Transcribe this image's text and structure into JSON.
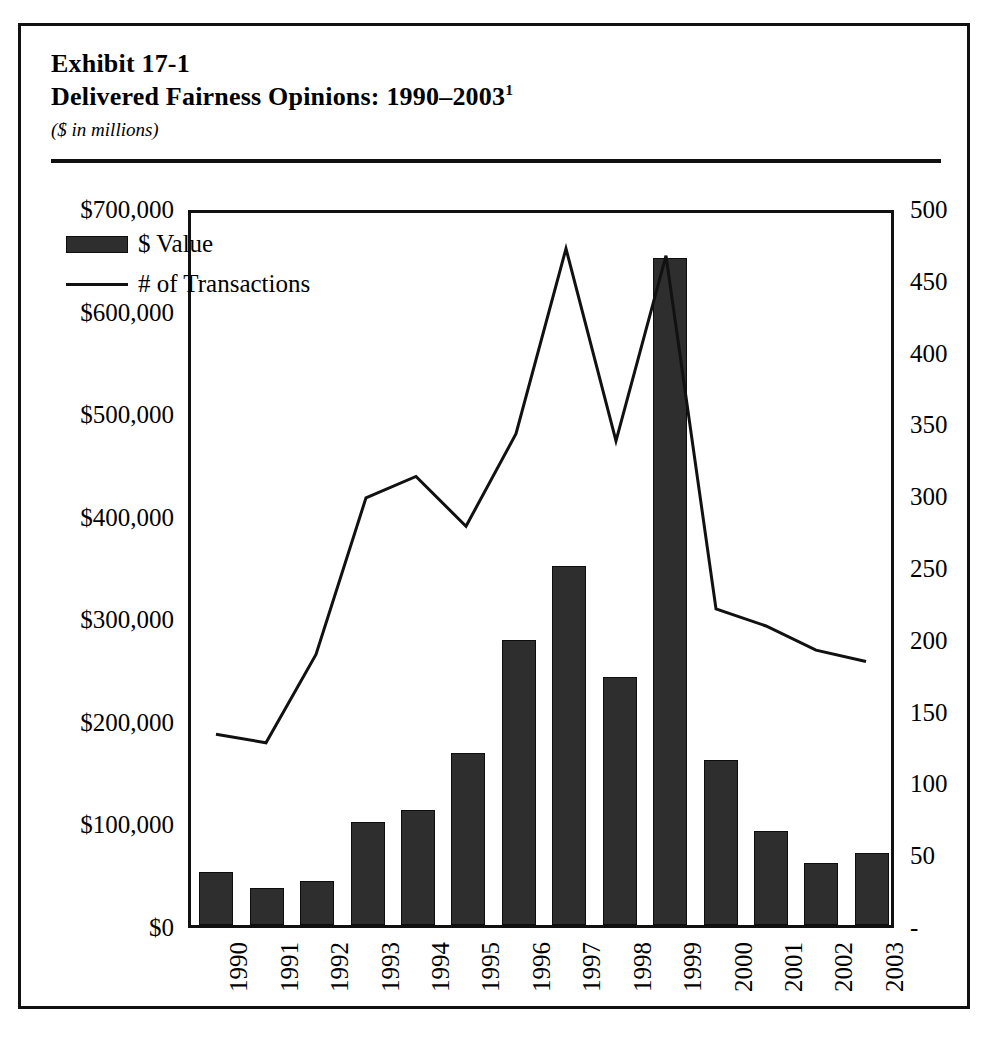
{
  "exhibit": {
    "number_label": "Exhibit 17-1",
    "title": "Delivered Fairness Opinions: 1990–2003",
    "title_footnote_marker": "1",
    "units_note": "($ in millions)"
  },
  "legend": {
    "items": [
      {
        "label": "$ Value",
        "marker": "filled-bar-swatch",
        "color": "#2e2e2e"
      },
      {
        "label": "# of Transactions",
        "marker": "line-swatch",
        "color": "#111111"
      }
    ]
  },
  "axes": {
    "left_ticks": [
      "$700,000",
      "$600,000",
      "$500,000",
      "$400,000",
      "$300,000",
      "$200,000",
      "$100,000",
      "$0"
    ],
    "right_ticks": [
      "500",
      "450",
      "400",
      "350",
      "300",
      "250",
      "200",
      "150",
      "100",
      "50",
      "-"
    ],
    "x_ticks": [
      "1990",
      "1991",
      "1992",
      "1993",
      "1994",
      "1995",
      "1996",
      "1997",
      "1998",
      "1999",
      "2000",
      "2001",
      "2002",
      "2003"
    ]
  },
  "chart_data": {
    "type": "bar",
    "title": "Delivered Fairness Opinions: 1990–2003",
    "subtitle": "($ in millions)",
    "xlabel": "",
    "ylabel": "$ Value",
    "y2label": "# of Transactions",
    "categories": [
      "1990",
      "1991",
      "1992",
      "1993",
      "1994",
      "1995",
      "1996",
      "1997",
      "1998",
      "1999",
      "2000",
      "2001",
      "2002",
      "2003"
    ],
    "ylim": [
      0,
      700000
    ],
    "y2lim": [
      0,
      500
    ],
    "ytick_values": [
      0,
      100000,
      200000,
      300000,
      400000,
      500000,
      600000,
      700000
    ],
    "y2tick_values": [
      0,
      50,
      100,
      150,
      200,
      250,
      300,
      350,
      400,
      450,
      500
    ],
    "grid": false,
    "legend_position": "upper-left-inside",
    "series": [
      {
        "name": "$ Value",
        "type": "bar",
        "axis": "left",
        "color": "#2e2e2e",
        "values": [
          52000,
          36000,
          43000,
          100000,
          112000,
          168000,
          278000,
          350000,
          242000,
          650000,
          161000,
          92000,
          60000,
          70000
        ]
      },
      {
        "name": "# of Transactions",
        "type": "line",
        "axis": "right",
        "color": "#111111",
        "values": [
          134,
          128,
          190,
          300,
          315,
          280,
          345,
          475,
          340,
          470,
          222,
          210,
          193,
          185
        ]
      }
    ]
  }
}
